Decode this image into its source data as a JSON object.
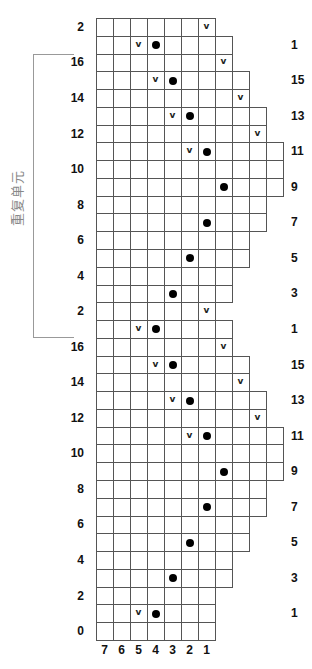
{
  "chart_title": "",
  "bracket": {
    "label": "重复单元",
    "covers_rows": "16 to 1 (first repeat)"
  },
  "column_labels": [
    "7",
    "6",
    "5",
    "4",
    "3",
    "2",
    "1"
  ],
  "legend_symbols": {
    "v": "v",
    "dot": "filled-dot"
  },
  "rows": [
    {
      "label": "2",
      "side": "left",
      "cells": 7,
      "v": [
        6
      ],
      "dot": []
    },
    {
      "label": "1",
      "side": "right",
      "cells": 8,
      "v": [
        2
      ],
      "dot": [
        3
      ]
    },
    {
      "label": "16",
      "side": "left",
      "cells": 8,
      "v": [
        7
      ],
      "dot": []
    },
    {
      "label": "15",
      "side": "right",
      "cells": 9,
      "v": [
        3
      ],
      "dot": [
        4
      ]
    },
    {
      "label": "14",
      "side": "left",
      "cells": 9,
      "v": [
        8
      ],
      "dot": []
    },
    {
      "label": "13",
      "side": "right",
      "cells": 10,
      "v": [
        4
      ],
      "dot": [
        5
      ]
    },
    {
      "label": "12",
      "side": "left",
      "cells": 10,
      "v": [
        9
      ],
      "dot": []
    },
    {
      "label": "11",
      "side": "right",
      "cells": 11,
      "v": [
        5
      ],
      "dot": [
        6
      ]
    },
    {
      "label": "10",
      "side": "left",
      "cells": 11,
      "v": [],
      "dot": []
    },
    {
      "label": "9",
      "side": "right",
      "cells": 11,
      "v": [],
      "dot": [
        7
      ]
    },
    {
      "label": "8",
      "side": "left",
      "cells": 10,
      "v": [],
      "dot": []
    },
    {
      "label": "7",
      "side": "right",
      "cells": 10,
      "v": [],
      "dot": [
        6
      ]
    },
    {
      "label": "6",
      "side": "left",
      "cells": 9,
      "v": [],
      "dot": []
    },
    {
      "label": "5",
      "side": "right",
      "cells": 9,
      "v": [],
      "dot": [
        5
      ]
    },
    {
      "label": "4",
      "side": "left",
      "cells": 8,
      "v": [],
      "dot": []
    },
    {
      "label": "3",
      "side": "right",
      "cells": 8,
      "v": [],
      "dot": [
        4
      ]
    },
    {
      "label": "2",
      "side": "left",
      "cells": 7,
      "v": [
        6
      ],
      "dot": []
    },
    {
      "label": "1",
      "side": "right",
      "cells": 8,
      "v": [
        2
      ],
      "dot": [
        3
      ]
    },
    {
      "label": "16",
      "side": "left",
      "cells": 8,
      "v": [
        7
      ],
      "dot": []
    },
    {
      "label": "15",
      "side": "right",
      "cells": 9,
      "v": [
        3
      ],
      "dot": [
        4
      ]
    },
    {
      "label": "14",
      "side": "left",
      "cells": 9,
      "v": [
        8
      ],
      "dot": []
    },
    {
      "label": "13",
      "side": "right",
      "cells": 10,
      "v": [
        4
      ],
      "dot": [
        5
      ]
    },
    {
      "label": "12",
      "side": "left",
      "cells": 10,
      "v": [
        9
      ],
      "dot": []
    },
    {
      "label": "11",
      "side": "right",
      "cells": 11,
      "v": [
        5
      ],
      "dot": [
        6
      ]
    },
    {
      "label": "10",
      "side": "left",
      "cells": 11,
      "v": [],
      "dot": []
    },
    {
      "label": "9",
      "side": "right",
      "cells": 11,
      "v": [],
      "dot": [
        7
      ]
    },
    {
      "label": "8",
      "side": "left",
      "cells": 10,
      "v": [],
      "dot": []
    },
    {
      "label": "7",
      "side": "right",
      "cells": 10,
      "v": [],
      "dot": [
        6
      ]
    },
    {
      "label": "6",
      "side": "left",
      "cells": 9,
      "v": [],
      "dot": []
    },
    {
      "label": "5",
      "side": "right",
      "cells": 9,
      "v": [],
      "dot": [
        5
      ]
    },
    {
      "label": "4",
      "side": "left",
      "cells": 8,
      "v": [],
      "dot": []
    },
    {
      "label": "3",
      "side": "right",
      "cells": 8,
      "v": [],
      "dot": [
        4
      ]
    },
    {
      "label": "2",
      "side": "left",
      "cells": 7,
      "v": [],
      "dot": []
    },
    {
      "label": "1",
      "side": "right",
      "cells": 7,
      "v": [
        2
      ],
      "dot": [
        3
      ]
    },
    {
      "label": "0",
      "side": "left",
      "cells": 7,
      "v": [],
      "dot": []
    }
  ]
}
